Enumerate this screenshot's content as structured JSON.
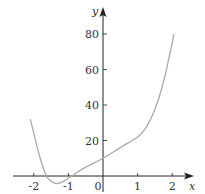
{
  "chart_data": {
    "type": "line",
    "title": "",
    "xlabel": "x",
    "ylabel": "y",
    "xlim": [
      -2.6,
      2.6
    ],
    "ylim": [
      -5,
      90
    ],
    "grid": false,
    "legend": null,
    "x_ticks": [
      -2,
      -1,
      0,
      1,
      2
    ],
    "x_tick_labels": [
      "-2",
      "-1",
      "0",
      "1",
      "2"
    ],
    "y_ticks": [
      20,
      40,
      60,
      80
    ],
    "y_tick_labels": [
      "20",
      "40",
      "60",
      "80"
    ],
    "series": [
      {
        "name": "curve",
        "color": "#aaaaaa",
        "x": [
          -2.1,
          -2.0,
          -1.9,
          -1.8,
          -1.7,
          -1.6,
          -1.5,
          -1.4,
          -1.3,
          -1.2,
          -1.1,
          -1.0,
          -0.9,
          -0.8,
          -0.5,
          0.0,
          0.5,
          1.0,
          1.2,
          1.4,
          1.6,
          1.8,
          1.9,
          2.0,
          2.05
        ],
        "y": [
          32,
          24,
          16,
          9,
          3,
          -1,
          -3,
          -4,
          -4.2,
          -3.6,
          -2.5,
          -1.2,
          0,
          1.3,
          5,
          10,
          16,
          22,
          26,
          33,
          43,
          57,
          66,
          75,
          80
        ]
      }
    ]
  },
  "axes": {
    "x_label": "x",
    "y_label": "y",
    "origin_label": "0"
  }
}
